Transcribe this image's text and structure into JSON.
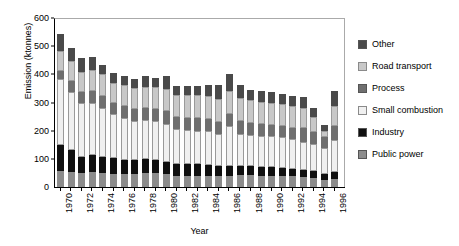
{
  "chart_data": {
    "type": "bar",
    "subtype": "stacked-vertical",
    "title": "",
    "xlabel": "Year",
    "ylabel": "Emission (ktonnes)",
    "ylim": [
      0,
      600
    ],
    "yticks": [
      0,
      100,
      200,
      300,
      400,
      500,
      600
    ],
    "grid": false,
    "legend_position": "right",
    "categories": [
      "1970",
      "1971",
      "1972",
      "1973",
      "1974",
      "1975",
      "1976",
      "1977",
      "1978",
      "1979",
      "1980",
      "1981",
      "1982",
      "1983",
      "1984",
      "1985",
      "1986",
      "1987",
      "1988",
      "1989",
      "1990",
      "1991",
      "1992",
      "1993",
      "1994",
      "1995",
      "1996"
    ],
    "xtick_labels": [
      "1970",
      "",
      "1972",
      "",
      "1974",
      "",
      "1976",
      "",
      "1978",
      "",
      "1980",
      "",
      "1982",
      "",
      "1984",
      "",
      "1986",
      "",
      "1988",
      "",
      "1990",
      "",
      "1992",
      "",
      "1994",
      "",
      "1996"
    ],
    "series": [
      {
        "name": "Public power",
        "color": "#8c8c8c",
        "values": [
          58,
          55,
          50,
          52,
          50,
          47,
          45,
          45,
          50,
          50,
          45,
          40,
          40,
          40,
          40,
          38,
          40,
          42,
          42,
          40,
          40,
          40,
          38,
          35,
          32,
          25,
          28
        ]
      },
      {
        "name": "Industry",
        "color": "#101010",
        "values": [
          92,
          75,
          58,
          62,
          55,
          55,
          52,
          50,
          50,
          46,
          45,
          40,
          40,
          40,
          38,
          35,
          35,
          32,
          32,
          30,
          30,
          28,
          26,
          25,
          24,
          22,
          24
        ]
      },
      {
        "name": "Small combustion",
        "color": "#f0f0f0",
        "values": [
          232,
          208,
          190,
          186,
          175,
          158,
          148,
          140,
          138,
          137,
          135,
          125,
          122,
          120,
          120,
          117,
          140,
          115,
          112,
          112,
          110,
          108,
          105,
          100,
          96,
          90,
          115
        ]
      },
      {
        "name": "Process",
        "color": "#6f6f6f",
        "values": [
          30,
          38,
          40,
          42,
          42,
          40,
          42,
          42,
          42,
          43,
          44,
          42,
          42,
          45,
          44,
          42,
          45,
          45,
          42,
          42,
          40,
          40,
          40,
          48,
          45,
          42,
          50
        ]
      },
      {
        "name": "Road transport",
        "color": "#c8c8c8",
        "values": [
          72,
          72,
          72,
          74,
          78,
          70,
          74,
          74,
          76,
          78,
          80,
          80,
          82,
          80,
          82,
          82,
          82,
          82,
          80,
          78,
          80,
          78,
          78,
          72,
          50,
          20,
          70
        ]
      },
      {
        "name": "Other",
        "color": "#4a4a4a",
        "values": [
          58,
          45,
          48,
          45,
          35,
          35,
          33,
          33,
          38,
          32,
          46,
          33,
          34,
          33,
          38,
          48,
          58,
          45,
          38,
          38,
          38,
          36,
          35,
          40,
          35,
          20,
          55
        ]
      }
    ],
    "totals": [
      542,
      493,
      458,
      461,
      435,
      405,
      394,
      384,
      394,
      386,
      395,
      360,
      360,
      358,
      362,
      362,
      400,
      361,
      346,
      340,
      338,
      330,
      322,
      320,
      282,
      219,
      342
    ]
  },
  "legend": {
    "items": [
      {
        "label": "Other",
        "color": "#4a4a4a"
      },
      {
        "label": "Road transport",
        "color": "#c8c8c8"
      },
      {
        "label": "Process",
        "color": "#6f6f6f"
      },
      {
        "label": "Small combustion",
        "color": "#f0f0f0"
      },
      {
        "label": "Industry",
        "color": "#101010"
      },
      {
        "label": "Public power",
        "color": "#8c8c8c"
      }
    ]
  }
}
